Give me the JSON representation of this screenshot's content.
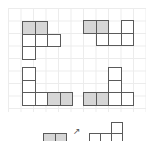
{
  "figure": {
    "cell_size": 12.5,
    "colors": {
      "border": "#5a5a5a",
      "shaded": "#d6d6d6",
      "grid": "#ececec"
    },
    "shapes": [
      {
        "id": "net-1",
        "origin": [
          22,
          21
        ],
        "cells": [
          [
            0,
            0,
            true
          ],
          [
            1,
            0,
            true
          ],
          [
            0,
            1,
            false
          ],
          [
            1,
            1,
            false
          ],
          [
            2,
            1,
            false
          ],
          [
            0,
            2,
            false
          ]
        ]
      },
      {
        "id": "net-2",
        "origin": [
          83,
          20
        ],
        "cells": [
          [
            0,
            0,
            true
          ],
          [
            1,
            0,
            true
          ],
          [
            3,
            0,
            false
          ],
          [
            1,
            1,
            false
          ],
          [
            2,
            1,
            false
          ],
          [
            3,
            1,
            false
          ]
        ]
      },
      {
        "id": "net-3",
        "origin": [
          22,
          67
        ],
        "cells": [
          [
            0,
            0,
            false
          ],
          [
            0,
            1,
            false
          ],
          [
            0,
            2,
            false
          ],
          [
            1,
            2,
            false
          ],
          [
            2,
            2,
            true
          ],
          [
            3,
            2,
            true
          ]
        ]
      },
      {
        "id": "net-4",
        "origin": [
          83,
          67
        ],
        "cells": [
          [
            2,
            0,
            false
          ],
          [
            2,
            1,
            false
          ],
          [
            0,
            2,
            true
          ],
          [
            1,
            2,
            true
          ],
          [
            2,
            2,
            false
          ],
          [
            3,
            2,
            false
          ]
        ]
      }
    ],
    "hint": {
      "arrow_symbol": "↗",
      "left_shape": {
        "origin": [
          43,
          133
        ],
        "cell": 11.5,
        "cells": [
          [
            0,
            0,
            true
          ],
          [
            1,
            0,
            true
          ]
        ]
      },
      "right_shape": {
        "origin": [
          89,
          122
        ],
        "cell": 11,
        "cells": [
          [
            2,
            0,
            false
          ],
          [
            0,
            1,
            false
          ],
          [
            1,
            1,
            false
          ],
          [
            2,
            1,
            false
          ]
        ]
      }
    }
  }
}
